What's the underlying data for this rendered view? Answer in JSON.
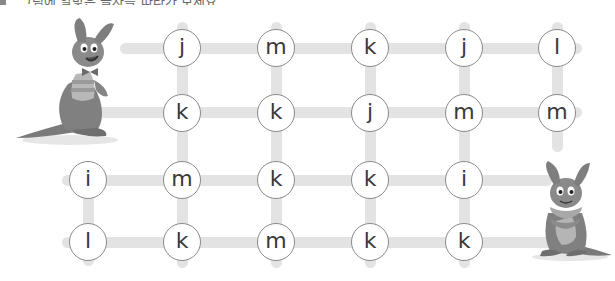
{
  "header": {
    "instruction_text": "그림에 알맞은 글자를 따라가 보세요"
  },
  "colors": {
    "line": "#e3e3e3",
    "circle_border": "#8a8a8a",
    "letter": "#3a3a3a",
    "kangaroo_body": "#7d7d7d",
    "kangaroo_light": "#bdbdbd"
  },
  "characters": [
    {
      "name": "kangaroo-left",
      "position": "top-left start"
    },
    {
      "name": "kangaroo-right",
      "position": "bottom-right goal"
    }
  ],
  "grid": {
    "rows": [
      {
        "cells": [
          {
            "letter": "j"
          },
          {
            "letter": "m"
          },
          {
            "letter": "k"
          },
          {
            "letter": "j"
          },
          {
            "letter": "l"
          }
        ]
      },
      {
        "cells": [
          {
            "letter": "k"
          },
          {
            "letter": "k"
          },
          {
            "letter": "j"
          },
          {
            "letter": "m"
          },
          {
            "letter": "m"
          }
        ]
      },
      {
        "cells": [
          {
            "letter": "i"
          },
          {
            "letter": "m"
          },
          {
            "letter": "k"
          },
          {
            "letter": "k"
          },
          {
            "letter": "i"
          }
        ]
      },
      {
        "cells": [
          {
            "letter": "l"
          },
          {
            "letter": "k"
          },
          {
            "letter": "m"
          },
          {
            "letter": "k"
          },
          {
            "letter": "k"
          }
        ]
      }
    ]
  }
}
